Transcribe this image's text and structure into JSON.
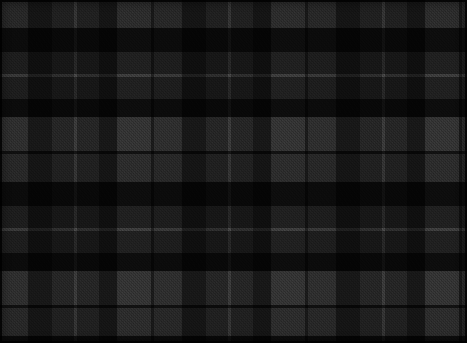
{
  "swatch": {
    "title": "Tartan Plaid Swatch",
    "pattern_name": "black-grey-tartan",
    "description": "Symmetric greyscale tartan / buffalo-check plaid textile swatch",
    "width_px": 467,
    "height_px": 343,
    "weave": "twill",
    "sett_repeat_px": 154,
    "background_color": "#1d1d1d",
    "selvedge_color": "#000000"
  },
  "palette": {
    "black": "#090909",
    "near_black": "#121212",
    "charcoal": "#242424",
    "dark_grey": "#2e2e2e",
    "mid_grey": "#3c3c3c",
    "grey": "#474747",
    "light_grey": "#545454",
    "pinstripe": "#6a6a6a"
  },
  "warp_sett": {
    "axis": "vertical",
    "repeat_px": 154,
    "bands": [
      {
        "color": "#474747",
        "width_px": 28,
        "name": "grey"
      },
      {
        "color": "#090909",
        "width_px": 24,
        "name": "black"
      },
      {
        "color": "#2e2e2e",
        "width_px": 22,
        "name": "dark-grey"
      },
      {
        "color": "#6a6a6a",
        "width_px": 3,
        "name": "pinstripe"
      },
      {
        "color": "#2e2e2e",
        "width_px": 22,
        "name": "dark-grey"
      },
      {
        "color": "#090909",
        "width_px": 18,
        "name": "black"
      },
      {
        "color": "#545454",
        "width_px": 34,
        "name": "light-grey"
      },
      {
        "color": "#121212",
        "width_px": 3,
        "name": "hairline"
      }
    ]
  },
  "weft_sett": {
    "axis": "horizontal",
    "repeat_px": 154,
    "bands": [
      {
        "color": "#474747",
        "width_px": 28,
        "name": "grey"
      },
      {
        "color": "#090909",
        "width_px": 24,
        "name": "black"
      },
      {
        "color": "#2e2e2e",
        "width_px": 22,
        "name": "dark-grey"
      },
      {
        "color": "#6a6a6a",
        "width_px": 3,
        "name": "pinstripe"
      },
      {
        "color": "#2e2e2e",
        "width_px": 22,
        "name": "dark-grey"
      },
      {
        "color": "#090909",
        "width_px": 18,
        "name": "black"
      },
      {
        "color": "#545454",
        "width_px": 34,
        "name": "light-grey"
      },
      {
        "color": "#121212",
        "width_px": 3,
        "name": "hairline"
      }
    ]
  },
  "texture": {
    "twill_angle_deg": 45,
    "twill_pitch_px": 3,
    "grain_pitch_px": 2,
    "noise_opacity": 0.2
  }
}
